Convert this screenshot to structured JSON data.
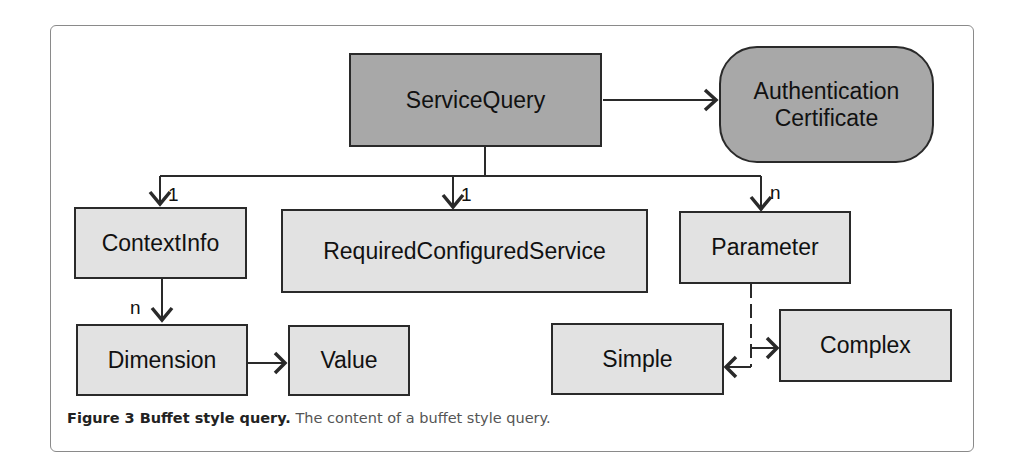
{
  "figure": {
    "nodes": {
      "service_query": "ServiceQuery",
      "auth_cert_line1": "Authentication",
      "auth_cert_line2": "Certificate",
      "context_info": "ContextInfo",
      "required_configured_service": "RequiredConfiguredService",
      "parameter": "Parameter",
      "dimension": "Dimension",
      "value": "Value",
      "simple": "Simple",
      "complex": "Complex"
    },
    "multiplicities": {
      "context_info": "1",
      "required_configured_service": "1",
      "parameter": "n",
      "dimension": "n"
    },
    "caption": {
      "label": "Figure 3 Buffet style query.",
      "text": " The content of a buffet style query."
    },
    "colors": {
      "root_fill": "#a8a8a8",
      "child_fill": "#e2e2e2",
      "stroke": "#2a2a2a"
    }
  }
}
